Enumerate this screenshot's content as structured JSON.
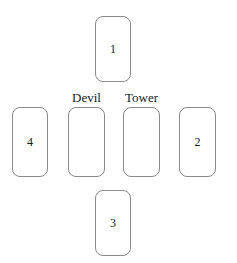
{
  "diagram": {
    "type": "tarot-cross-spread",
    "background_color": "#ffffff",
    "card_border_color": "#8a8a8a",
    "text_color": "#1a1a1a",
    "cards": [
      {
        "id": "card-1",
        "position_name": "top",
        "number": "1",
        "label": "",
        "x": 95,
        "y": 16,
        "width": 36,
        "height": 66
      },
      {
        "id": "card-4",
        "position_name": "far-left",
        "number": "4",
        "label": "",
        "x": 12,
        "y": 107,
        "width": 36,
        "height": 70
      },
      {
        "id": "card-devil",
        "position_name": "center-left",
        "number": "",
        "label": "Devil",
        "x": 68,
        "y": 107,
        "width": 37,
        "height": 70
      },
      {
        "id": "card-tower",
        "position_name": "center-right",
        "number": "",
        "label": "Tower",
        "x": 123,
        "y": 107,
        "width": 37,
        "height": 70
      },
      {
        "id": "card-2",
        "position_name": "far-right",
        "number": "2",
        "label": "",
        "x": 179,
        "y": 107,
        "width": 37,
        "height": 70
      },
      {
        "id": "card-3",
        "position_name": "bottom",
        "number": "3",
        "label": "",
        "x": 95,
        "y": 190,
        "width": 36,
        "height": 66
      }
    ],
    "labels": [
      {
        "text": "Devil",
        "x": 68,
        "y": 91,
        "width": 37
      },
      {
        "text": "Tower",
        "x": 121,
        "y": 91,
        "width": 41
      }
    ]
  }
}
